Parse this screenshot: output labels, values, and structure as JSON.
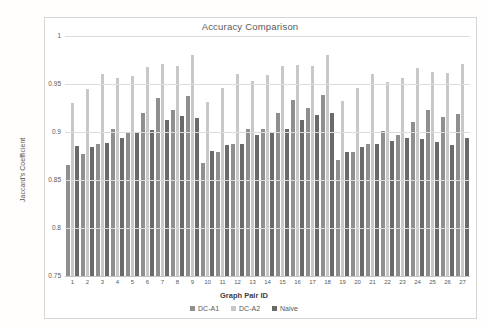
{
  "chart_data": {
    "type": "bar",
    "title": "Accuracy Comparison",
    "xlabel": "Graph Pair ID",
    "ylabel": "Jaccard's Coefficient",
    "ylim": [
      0.75,
      1.0
    ],
    "grid": "horizontal",
    "legend_position": "bottom",
    "yticks": [
      {
        "value": 1.0,
        "label": "1"
      },
      {
        "value": 0.95,
        "label": "0.95"
      },
      {
        "value": 0.9,
        "label": "0.9"
      },
      {
        "value": 0.85,
        "label": "0.85"
      },
      {
        "value": 0.8,
        "label": "0.8"
      },
      {
        "value": 0.75,
        "label": "0.75"
      }
    ],
    "categories": [
      "1",
      "2",
      "3",
      "4",
      "5",
      "6",
      "7",
      "8",
      "9",
      "10",
      "11",
      "12",
      "13",
      "14",
      "15",
      "16",
      "17",
      "18",
      "19",
      "20",
      "21",
      "22",
      "23",
      "24",
      "25",
      "26",
      "27"
    ],
    "series": [
      {
        "name": "DC-A1",
        "color": "#8f8f8f",
        "values": [
          0.866,
          0.877,
          0.888,
          0.903,
          0.9,
          0.92,
          0.935,
          0.923,
          0.937,
          0.868,
          0.879,
          0.888,
          0.903,
          0.903,
          0.92,
          0.933,
          0.925,
          0.939,
          0.871,
          0.879,
          0.888,
          0.901,
          0.897,
          0.91,
          0.923,
          0.916,
          0.919
        ]
      },
      {
        "name": "DC-A2",
        "color": "#c8c8c8",
        "values": [
          0.93,
          0.945,
          0.96,
          0.956,
          0.958,
          0.968,
          0.971,
          0.969,
          0.98,
          0.931,
          0.946,
          0.96,
          0.953,
          0.959,
          0.969,
          0.97,
          0.969,
          0.98,
          0.932,
          0.946,
          0.96,
          0.952,
          0.956,
          0.967,
          0.962,
          0.961,
          0.971
        ]
      },
      {
        "name": "Naive",
        "color": "#6a6a6a",
        "values": [
          0.885,
          0.884,
          0.889,
          0.894,
          0.9,
          0.902,
          0.913,
          0.917,
          0.915,
          0.88,
          0.886,
          0.888,
          0.897,
          0.9,
          0.903,
          0.913,
          0.918,
          0.92,
          0.879,
          0.884,
          0.888,
          0.891,
          0.894,
          0.893,
          0.89,
          0.886,
          0.894
        ]
      }
    ]
  },
  "colors": {
    "text": "#595959",
    "grid": "#dcdcdc",
    "baseline": "#c4c4c4",
    "chart_border": "#d6d6d6",
    "background": "#ffffff"
  }
}
